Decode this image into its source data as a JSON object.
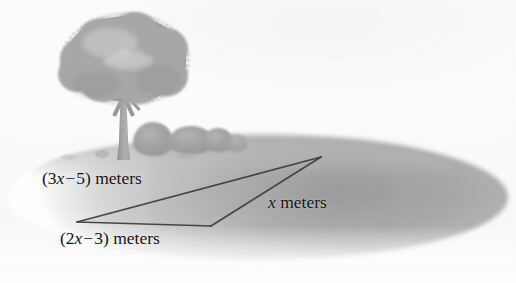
{
  "figure": {
    "type": "geometry-illustration",
    "background_color": "#ffffff",
    "ground_color": "#ababab",
    "foliage_color": "#a9a9a9",
    "line_color": "#3c3c3c"
  },
  "labels": {
    "side_top": {
      "open_paren": "(",
      "coefficient": "3",
      "variable": "x",
      "operator": "−",
      "constant": "5",
      "close_paren": ")",
      "unit": "meters",
      "full_text": "(3x − 5) meters"
    },
    "side_bottom": {
      "open_paren": "(",
      "coefficient": "2",
      "variable": "x",
      "operator": "−",
      "constant": "3",
      "close_paren": ")",
      "unit": "meters",
      "full_text": "(2x − 3) meters"
    },
    "side_right": {
      "variable": "x",
      "unit": "meters",
      "full_text": "x meters"
    }
  },
  "geometry": {
    "vertices": {
      "right_apex": {
        "x": 321,
        "y": 157
      },
      "left_apex": {
        "x": 77,
        "y": 222
      },
      "bottom_apex": {
        "x": 211,
        "y": 226
      }
    },
    "sides": [
      {
        "name": "top",
        "from": "left_apex",
        "to": "right_apex",
        "label": "(3x − 5) meters"
      },
      {
        "name": "bottom",
        "from": "left_apex",
        "to": "bottom_apex",
        "label": "(2x − 3) meters"
      },
      {
        "name": "right",
        "from": "bottom_apex",
        "to": "right_apex",
        "label": "x meters"
      }
    ]
  },
  "scenery": {
    "tree": {
      "name": "deciduous-tree",
      "canopy_cx": 125,
      "canopy_cy": 58
    },
    "bushes": [
      {
        "cx": 152,
        "cy": 140
      },
      {
        "cx": 190,
        "cy": 141
      },
      {
        "cx": 216,
        "cy": 143
      }
    ]
  }
}
